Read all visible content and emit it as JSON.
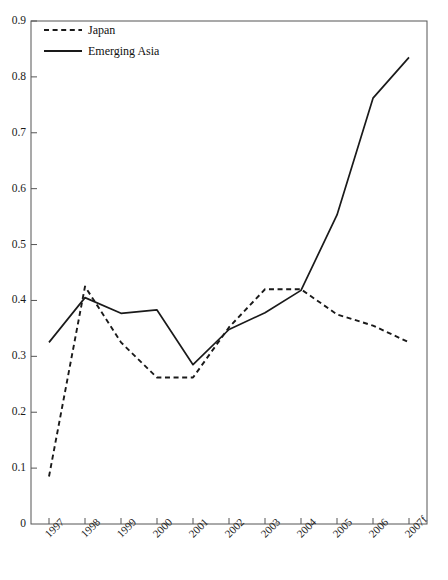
{
  "chart_data": {
    "type": "line",
    "title": "",
    "xlabel": "",
    "ylabel": "",
    "x": [
      "1997",
      "1998",
      "1999",
      "2000",
      "2001",
      "2002",
      "2003",
      "2004",
      "2005",
      "2006",
      "2007f"
    ],
    "categories": [
      "1997",
      "1998",
      "1999",
      "2000",
      "2001",
      "2002",
      "2003",
      "2004",
      "2005",
      "2006",
      "2007f"
    ],
    "series": [
      {
        "name": "Japan",
        "style": "dashed",
        "color": "#1a1a1a",
        "values": [
          0.085,
          0.425,
          0.325,
          0.262,
          0.262,
          0.352,
          0.42,
          0.42,
          0.375,
          0.355,
          0.325
        ]
      },
      {
        "name": "Emerging Asia",
        "style": "solid",
        "color": "#1a1a1a",
        "values": [
          0.325,
          0.405,
          0.377,
          0.383,
          0.285,
          0.348,
          0.378,
          0.418,
          0.553,
          0.762,
          0.835
        ]
      }
    ],
    "ylim": [
      0.0,
      0.9
    ],
    "yticks": [
      "0",
      "0.1",
      "0.2",
      "0.3",
      "0.4",
      "0.5",
      "0.6",
      "0.7",
      "0.8",
      "0.9"
    ],
    "ytick_values": [
      0.0,
      0.1,
      0.2,
      0.3,
      0.4,
      0.5,
      0.6,
      0.7,
      0.8,
      0.9
    ],
    "grid": false,
    "legend_position": "top-left",
    "legend": [
      "Japan",
      "Emerging Asia"
    ]
  },
  "legend": {
    "items": [
      {
        "label": "Japan",
        "style": "dashed"
      },
      {
        "label": "Emerging Asia",
        "style": "solid"
      }
    ]
  },
  "axes": {
    "frame_color": "#555555",
    "line_color": "#1a1a1a"
  }
}
